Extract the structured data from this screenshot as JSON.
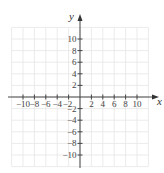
{
  "chart_data": {
    "type": "scatter",
    "title": "",
    "xlabel": "x",
    "ylabel": "y",
    "xlim": [
      -12,
      12
    ],
    "ylim": [
      -12,
      12
    ],
    "grid": true,
    "grid_step": 2,
    "x_ticks": [
      -10,
      -8,
      -6,
      -4,
      -2,
      2,
      4,
      6,
      8,
      10
    ],
    "y_ticks": [
      10,
      8,
      6,
      4,
      2,
      -2,
      -4,
      -6,
      -8,
      -10
    ],
    "x_tick_labels": [
      "−10",
      "−8",
      "−6",
      "−4",
      "−2",
      "2",
      "4",
      "6",
      "8",
      "10"
    ],
    "y_tick_labels": [
      "10",
      "8",
      "6",
      "4",
      "2",
      "−2",
      "−4",
      "−6",
      "−8",
      "−10"
    ],
    "series": [],
    "legend": null
  },
  "colors": {
    "grid": "#e6e6e6",
    "axis": "#444444",
    "background": "#ffffff"
  }
}
